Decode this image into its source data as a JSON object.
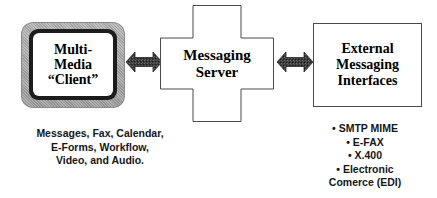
{
  "diagram": {
    "nodes": {
      "client": {
        "name": "Multi-Media Client",
        "shape": "monitor",
        "lines": [
          "Multi-",
          "Media",
          "“Client”"
        ],
        "fill": "#ffffff",
        "bezel_color": "#aeaeae",
        "inner_border_color": "#1c1c1c"
      },
      "server": {
        "name": "Messaging Server",
        "shape": "cross",
        "lines": [
          "Messaging",
          "Server"
        ],
        "fill": "#ffffff",
        "stroke": "#4a4a4a"
      },
      "external": {
        "name": "External Messaging Interfaces",
        "shape": "rectangle",
        "lines": [
          "External",
          "Messaging",
          "Interfaces"
        ],
        "fill": "#ffffff",
        "stroke": "#4a4a4a"
      }
    },
    "connectors": [
      {
        "id": "client-server",
        "type": "double-headed-arrow",
        "from": "client",
        "to": "server",
        "fill": "#3a3a3a"
      },
      {
        "id": "server-external",
        "type": "double-headed-arrow",
        "from": "server",
        "to": "external",
        "fill": "#3a3a3a"
      }
    ],
    "captions": {
      "left": {
        "name": "client-capabilities-caption",
        "lines": [
          "Messages, Fax, Calendar,",
          "E-Forms, Workflow,",
          "Video, and Audio."
        ]
      },
      "right": {
        "name": "external-interfaces-list",
        "lines": [
          "• SMTP MIME",
          "• E-FAX",
          "• X.400",
          "• Electronic",
          "Comerce (EDI)"
        ]
      }
    }
  }
}
